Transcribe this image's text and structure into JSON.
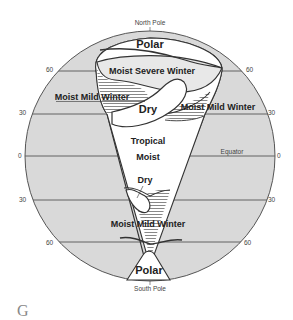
{
  "figure": {
    "letter": "G",
    "colors": {
      "ocean_fill": "#d9d9d9",
      "land_fill": "#ffffff",
      "outline": "#333333",
      "hatch": "#555555"
    }
  },
  "poles": {
    "north": "North Pole",
    "south": "South Pole"
  },
  "latitudes": {
    "n60_left": "60",
    "n60_right": "60",
    "n30_left": "30",
    "n30_right": "30",
    "eq_left": "0",
    "eq_right": "0",
    "s30_left": "30",
    "s30_right": "30",
    "s60_left": "60",
    "s60_right": "60",
    "equator_label": "Equator"
  },
  "zones": {
    "north_polar": "Polar",
    "moist_severe_winter": "Moist Severe Winter",
    "moist_mild_winter_west": "Moist Mild Winter",
    "moist_mild_winter_east": "Moist Mild Winter",
    "dry_north": "Dry",
    "tropical_moist_line1": "Tropical",
    "tropical_moist_line2": "Moist",
    "dry_south": "Dry",
    "moist_mild_winter_south": "Moist Mild Winter",
    "south_polar": "Polar"
  }
}
